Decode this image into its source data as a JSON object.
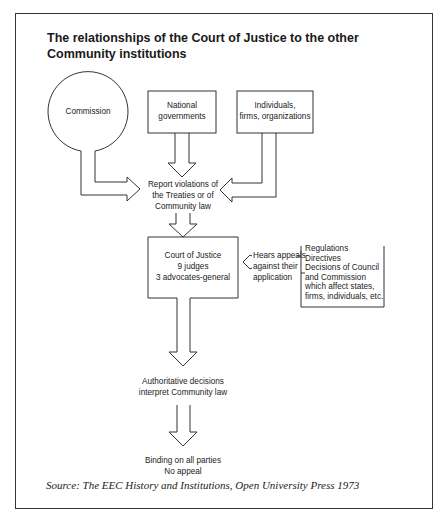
{
  "title": {
    "line1": "The relationships of the Court of Justice to the other",
    "line2": "Community institutions"
  },
  "nodes": {
    "commission": {
      "label": "Commission"
    },
    "national_governments": {
      "line1": "National",
      "line2": "governments"
    },
    "individuals": {
      "line1": "Individuals,",
      "line2": "firms, organizations"
    },
    "report_violations": {
      "line1": "Report violations of",
      "line2": "the Treaties or of",
      "line3": "Community law"
    },
    "court_of_justice": {
      "line1": "Court of Justice",
      "line2": "9 judges",
      "line3": "3 advocates-general"
    },
    "hears_appeals": {
      "line1": "Hears appeals",
      "line2": "against their",
      "line3": "application"
    },
    "legislation": {
      "lines": [
        "Regulations",
        "Directives",
        "Decisions of Council",
        "and Commission",
        "which affect states,",
        "firms, individuals, etc."
      ]
    },
    "authoritative_decisions": {
      "line1": "Authoritative decisions",
      "line2": "interpret Community law"
    },
    "binding": {
      "line1": "Binding on all parties",
      "line2": "No appeal"
    }
  },
  "edges": [
    {
      "from": "commission",
      "to": "report_violations"
    },
    {
      "from": "national_governments",
      "to": "report_violations"
    },
    {
      "from": "individuals",
      "to": "report_violations"
    },
    {
      "from": "report_violations",
      "to": "court_of_justice"
    },
    {
      "from": "legislation",
      "to": "court_of_justice",
      "label": "hears_appeals"
    },
    {
      "from": "court_of_justice",
      "to": "authoritative_decisions"
    },
    {
      "from": "authoritative_decisions",
      "to": "binding"
    }
  ],
  "source": "Source: The EEC History and Institutions, Open University Press 1973"
}
